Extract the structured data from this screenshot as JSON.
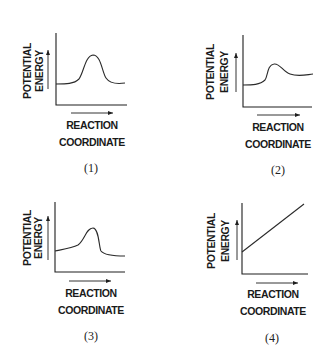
{
  "figure": {
    "panels": [
      {
        "id": 1,
        "caption": "(1)",
        "y_label_line1": "POTENTIAL",
        "y_label_line2": "ENERGY",
        "x_label_line1": "REACTION",
        "x_label_line2": "COORDINATE",
        "curve_shape": "reactants and products at equal energy with a large symmetric energy barrier"
      },
      {
        "id": 2,
        "caption": "(2)",
        "y_label_line1": "POTENTIAL",
        "y_label_line2": "ENERGY",
        "x_label_line1": "REACTION",
        "x_label_line2": "COORDINATE",
        "curve_shape": "products higher than reactants (endothermic) with a small energy barrier"
      },
      {
        "id": 3,
        "caption": "(3)",
        "y_label_line1": "POTENTIAL",
        "y_label_line2": "ENERGY",
        "x_label_line1": "REACTION",
        "x_label_line2": "COORDINATE",
        "curve_shape": "products slightly lower than reactants with a skewed energy barrier"
      },
      {
        "id": 4,
        "caption": "(4)",
        "y_label_line1": "POTENTIAL",
        "y_label_line2": "ENERGY",
        "x_label_line1": "REACTION",
        "x_label_line2": "COORDINATE",
        "curve_shape": "straight line increasing steadily"
      }
    ]
  }
}
